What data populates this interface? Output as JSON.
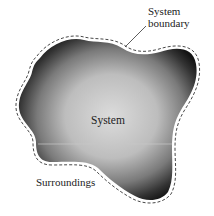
{
  "diagram": {
    "labels": {
      "boundary_line1": "System",
      "boundary_line2": "boundary",
      "system": "System",
      "surroundings": "Surroundings"
    },
    "colors": {
      "background": "#ffffff",
      "system_center": "#d9d9d9",
      "system_edge": "#1a1a1a",
      "boundary_dash": "#333333",
      "text": "#222222"
    },
    "elements": [
      {
        "type": "region",
        "name": "system",
        "description": "Irregular blob-shaped region with radial gray gradient, dark at edges"
      },
      {
        "type": "dashed-outline",
        "name": "system-boundary",
        "description": "Dashed line surrounding the system region"
      },
      {
        "type": "leader-line",
        "name": "boundary-pointer",
        "from": "System boundary label",
        "to": "dashed outline"
      }
    ]
  }
}
